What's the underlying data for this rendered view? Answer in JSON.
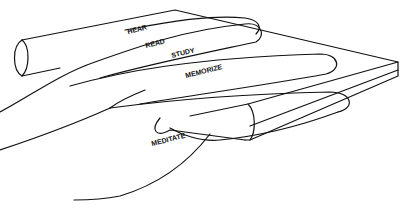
{
  "diagram": {
    "fingers": [
      {
        "label": "HEAR"
      },
      {
        "label": "READ"
      },
      {
        "label": "STUDY"
      },
      {
        "label": "MEMORIZE"
      },
      {
        "label": "MEDITATE"
      }
    ]
  }
}
